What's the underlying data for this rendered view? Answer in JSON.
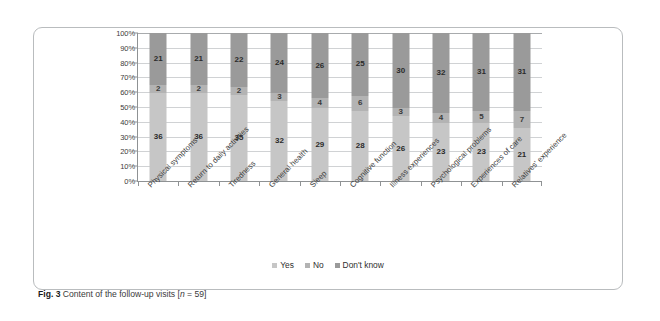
{
  "figure": {
    "caption_label": "Fig. 3",
    "caption_text": "Content of the follow-up visits [n = 59]",
    "caption_n_prefix": "[",
    "caption_n_italic": "n",
    "caption_n_suffix": " = 59]",
    "caption_body": "Content of the follow-up visits "
  },
  "legend": {
    "position": "bottom-center",
    "items": [
      {
        "label": "Yes",
        "color": "#c6c6c6"
      },
      {
        "label": "No",
        "color": "#b3b3b3"
      },
      {
        "label": "Don't know",
        "color": "#9a9a9a"
      }
    ]
  },
  "axis": {
    "y_ticks": [
      "100%",
      "90%",
      "80%",
      "70%",
      "60%",
      "50%",
      "40%",
      "30%",
      "20%",
      "10%",
      "0%"
    ]
  },
  "chart_data": {
    "type": "bar",
    "subtype": "100% stacked column",
    "title": "Content of the follow-up visits",
    "xlabel": "",
    "ylabel": "",
    "ylim": [
      0,
      100
    ],
    "ytick_values": [
      0,
      10,
      20,
      30,
      40,
      50,
      60,
      70,
      80,
      90,
      100
    ],
    "ytick_labels": [
      "0%",
      "10%",
      "20%",
      "30%",
      "40%",
      "50%",
      "60%",
      "70%",
      "80%",
      "90%",
      "100%"
    ],
    "grid": true,
    "n": 59,
    "value_unit": "count",
    "stack_order_bottom_to_top": [
      "Yes",
      "No",
      "Don't know"
    ],
    "categories": [
      "Physical symptoms",
      "Return to daily activities",
      "Tiredness",
      "General health",
      "Sleep",
      "Cognitive function",
      "Illness experiences",
      "Psychological problems",
      "Experiences of care",
      "Relatives' experience"
    ],
    "series": [
      {
        "name": "Yes",
        "color": "#c6c6c6",
        "values": [
          36,
          36,
          35,
          32,
          29,
          28,
          26,
          23,
          23,
          21
        ]
      },
      {
        "name": "No",
        "color": "#b3b3b3",
        "values": [
          2,
          2,
          2,
          3,
          4,
          6,
          3,
          4,
          5,
          7
        ]
      },
      {
        "name": "Don't know",
        "color": "#9a9a9a",
        "values": [
          21,
          21,
          22,
          24,
          26,
          25,
          30,
          32,
          31,
          31
        ]
      }
    ]
  }
}
